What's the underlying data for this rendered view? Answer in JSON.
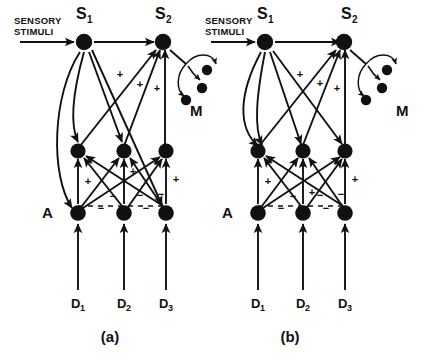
{
  "figure": {
    "type": "neural-circuit-diagram",
    "background_color": "#ffffff",
    "ink_color": "#111111",
    "panels": [
      {
        "id": "a",
        "caption": "(a)",
        "input_label_line1": "SENSORY",
        "input_label_line2": "STIMULI",
        "s1_label": "S",
        "s1_sub": "1",
        "s2_label": "S",
        "s2_sub": "2",
        "a_label": "A",
        "m_label": "M",
        "d_labels": [
          {
            "base": "D",
            "sub": "1"
          },
          {
            "base": "D",
            "sub": "2"
          },
          {
            "base": "D",
            "sub": "3"
          }
        ],
        "plus_signs": [
          "+",
          "+",
          "+",
          "+",
          "+",
          "+"
        ],
        "minus_signs": [
          "−",
          "−",
          "−",
          "−",
          "−"
        ]
      },
      {
        "id": "b",
        "caption": "(b)",
        "input_label_line1": "SENSORY",
        "input_label_line2": "STIMULI",
        "s1_label": "S",
        "s1_sub": "1",
        "s2_label": "S",
        "s2_sub": "2",
        "a_label": "A",
        "m_label": "M",
        "d_labels": [
          {
            "base": "D",
            "sub": "1"
          },
          {
            "base": "D",
            "sub": "2"
          },
          {
            "base": "D",
            "sub": "3"
          }
        ],
        "plus_signs": [
          "+",
          "+",
          "+",
          "+",
          "+",
          "+"
        ],
        "minus_signs": [
          "−",
          "−",
          "−",
          "−",
          "−"
        ]
      }
    ]
  }
}
